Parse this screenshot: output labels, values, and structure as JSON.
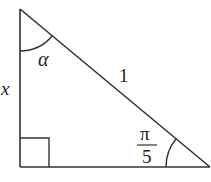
{
  "diagram": {
    "type": "right-triangle",
    "colors": {
      "stroke": "#333333",
      "text": "#222222",
      "background": "#ffffff"
    },
    "vertices": {
      "top": [
        20,
        9
      ],
      "right_angle": [
        20,
        167
      ],
      "bottom_right": [
        210,
        167
      ]
    },
    "labels": {
      "left_side": "x",
      "hypotenuse": "1",
      "top_angle": "α",
      "bottom_angle_numerator": "π",
      "bottom_angle_denominator": "5"
    },
    "right_angle_marker": true
  }
}
